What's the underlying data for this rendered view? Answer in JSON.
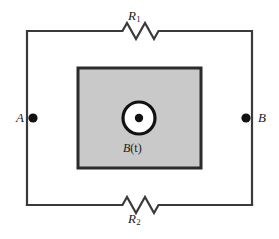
{
  "figure": {
    "kind": "circuit-diagram",
    "background_color": "#ffffff",
    "wire_color": "#3a3a3a",
    "field_region_fill": "#c9c9c9",
    "field_region_border": "#2b2b2b",
    "terminal_dot_color": "#111111"
  },
  "labels": {
    "resistor_top": "R",
    "resistor_top_sub": "1",
    "resistor_bottom": "R",
    "resistor_bottom_sub": "2",
    "terminal_left": "A",
    "terminal_right": "B",
    "field_name": "B",
    "field_arg": "(t)"
  },
  "geometry": {
    "loop": {
      "left": 27,
      "top": 31,
      "right": 252,
      "bottom": 205
    },
    "field_box": {
      "left": 78,
      "top": 68,
      "right": 201,
      "bottom": 168
    },
    "field_circle": {
      "cx": 139,
      "cy": 118,
      "r_outer": 18,
      "r_inner": 14,
      "r_dot": 4
    },
    "terminal_left_dot": {
      "cx": 33,
      "cy": 118,
      "r": 4.5
    },
    "terminal_right_dot": {
      "cx": 246,
      "cy": 118,
      "r": 4.5
    },
    "resistor_top": {
      "x_start": 118,
      "x_end": 162,
      "y": 31,
      "peaks": 4
    },
    "resistor_bottom": {
      "x_start": 118,
      "x_end": 162,
      "y": 205,
      "peaks": 4
    }
  }
}
